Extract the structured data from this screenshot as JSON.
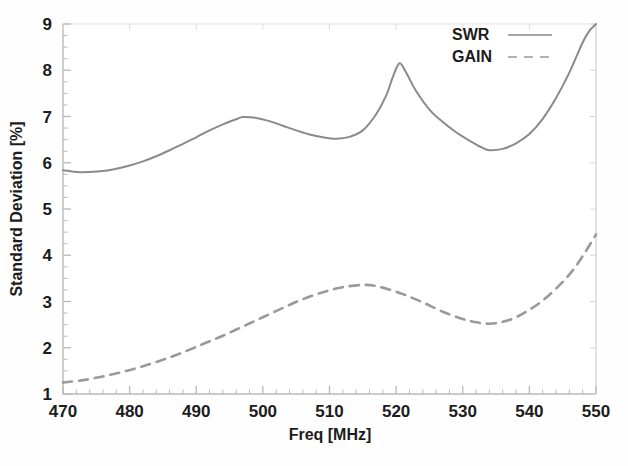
{
  "chart_data": {
    "type": "line",
    "title": "",
    "xlabel": "Freq [MHz]",
    "ylabel": "Standard Deviation [%]",
    "xlim": [
      470,
      550
    ],
    "ylim": [
      1,
      9
    ],
    "xticks": [
      470,
      480,
      490,
      500,
      510,
      520,
      530,
      540,
      550
    ],
    "yticks": [
      1,
      2,
      3,
      4,
      5,
      6,
      7,
      8,
      9
    ],
    "xtick_labels": [
      "470",
      "480",
      "490",
      "500",
      "510",
      "520",
      "530",
      "540",
      "550"
    ],
    "ytick_labels": [
      "1",
      "2",
      "3",
      "4",
      "5",
      "6",
      "7",
      "8",
      "9"
    ],
    "grid": false,
    "minor_ticks": true,
    "legend_position": "top-right",
    "series": [
      {
        "name": "SWR",
        "style": "solid",
        "color": "#8a8a8a",
        "x": [
          470,
          472,
          474,
          476,
          478,
          480,
          482,
          484,
          486,
          488,
          490,
          492,
          494,
          496,
          497,
          499,
          501,
          503,
          505,
          507,
          509,
          511,
          513,
          515,
          517,
          518.5,
          519.5,
          520.5,
          521.5,
          523,
          525,
          527,
          529,
          531,
          533,
          534,
          536,
          538,
          540,
          542,
          544,
          546,
          548,
          549,
          550
        ],
        "y": [
          5.84,
          5.8,
          5.8,
          5.82,
          5.87,
          5.94,
          6.03,
          6.14,
          6.27,
          6.41,
          6.55,
          6.7,
          6.83,
          6.94,
          6.99,
          6.97,
          6.9,
          6.8,
          6.7,
          6.61,
          6.55,
          6.52,
          6.56,
          6.7,
          7.05,
          7.45,
          7.85,
          8.15,
          7.95,
          7.55,
          7.15,
          6.88,
          6.66,
          6.48,
          6.32,
          6.27,
          6.3,
          6.42,
          6.62,
          6.95,
          7.4,
          7.95,
          8.6,
          8.85,
          9.0
        ]
      },
      {
        "name": "GAIN",
        "style": "dashed",
        "color": "#9a9a9a",
        "x": [
          470,
          473,
          476,
          479,
          482,
          485,
          488,
          491,
          494,
          497,
          500,
          503,
          506,
          509,
          512,
          515.5,
          518,
          521,
          524,
          527,
          530,
          532,
          534,
          536,
          538,
          540,
          542,
          544,
          546,
          548,
          550
        ],
        "y": [
          1.25,
          1.3,
          1.38,
          1.48,
          1.6,
          1.74,
          1.9,
          2.08,
          2.26,
          2.46,
          2.66,
          2.86,
          3.05,
          3.2,
          3.31,
          3.36,
          3.3,
          3.16,
          2.98,
          2.78,
          2.62,
          2.55,
          2.52,
          2.56,
          2.66,
          2.82,
          3.02,
          3.28,
          3.58,
          3.98,
          4.45
        ]
      }
    ],
    "legend": [
      {
        "label": "SWR",
        "style": "solid"
      },
      {
        "label": "GAIN",
        "style": "dashed"
      }
    ],
    "plot_area": {
      "left": 63,
      "right": 596,
      "top": 24,
      "bottom": 394
    },
    "axis_color": "#b9b9b9",
    "text_color": "#1c1c1c"
  }
}
